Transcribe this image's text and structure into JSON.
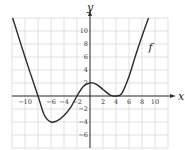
{
  "chart_data": {
    "type": "line",
    "title": "",
    "xlabel": "x",
    "ylabel": "y",
    "xlim": [
      -12,
      12
    ],
    "ylim": [
      -8,
      12
    ],
    "grid": true,
    "grid_step": 2,
    "x_ticks": [
      -10,
      -6,
      -4,
      -2,
      2,
      4,
      6,
      8,
      10
    ],
    "y_ticks": [
      10,
      8,
      6,
      4,
      2,
      -2,
      -4,
      -6
    ],
    "series": [
      {
        "name": "f",
        "x": [
          -11.9,
          -10,
          -8,
          -7,
          -6,
          -5,
          -4,
          -3,
          -2,
          -1,
          0,
          1,
          2,
          3,
          3.5,
          4,
          4.5,
          5,
          6,
          7,
          8,
          9
        ],
        "y": [
          12,
          6,
          0,
          -3,
          -4,
          -3.8,
          -3,
          -1.8,
          0,
          1.5,
          2,
          1.8,
          1,
          0.2,
          0,
          0,
          0.1,
          0.6,
          3,
          6.2,
          9.2,
          12
        ]
      }
    ],
    "annotations": [
      {
        "text": "f",
        "x": 9,
        "y": 7
      }
    ]
  },
  "labels": {
    "x_axis": "x",
    "y_axis": "y",
    "curve": "f"
  }
}
